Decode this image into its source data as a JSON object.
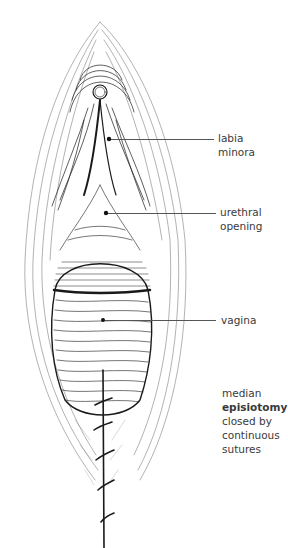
{
  "figure": {
    "labels": [
      {
        "id": "labia-minora",
        "lines": [
          "labia",
          "minora"
        ]
      },
      {
        "id": "urethral-opening",
        "lines": [
          "urethral",
          "opening"
        ]
      },
      {
        "id": "vagina",
        "lines": [
          "vagina"
        ]
      }
    ],
    "annotation": {
      "line1": "median",
      "line2_bold": "episiotomy",
      "line3": "closed by",
      "line4": "continuous",
      "line5": "sutures"
    },
    "colors": {
      "ink": "#1a1a1a",
      "text": "#3a3a3a",
      "leader": "#555555",
      "background": "#ffffff"
    }
  }
}
